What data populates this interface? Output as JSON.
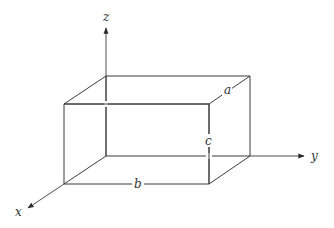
{
  "figure": {
    "axes": [
      {
        "name": "x",
        "label": "x"
      },
      {
        "name": "y",
        "label": "y"
      },
      {
        "name": "z",
        "label": "z"
      }
    ],
    "dimensions": {
      "depth_label": "a",
      "width_label": "b",
      "height_label": "c"
    },
    "colors": {
      "line": "#3a3a3a",
      "text": "#333333",
      "background": "#ffffff"
    }
  }
}
